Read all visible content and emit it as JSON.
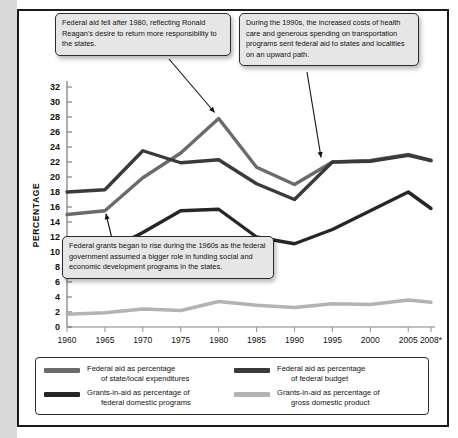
{
  "chart_data": {
    "type": "line",
    "title": "",
    "xlabel": "",
    "ylabel": "PERCENTAGE",
    "xlim": [
      1960,
      2008
    ],
    "ylim": [
      0,
      32
    ],
    "grid": false,
    "legend_position": "bottom",
    "x": [
      1960,
      1965,
      1970,
      1975,
      1980,
      1985,
      1990,
      1995,
      2000,
      2005,
      2008
    ],
    "xticklabels": [
      "1960",
      "1965",
      "1970",
      "1975",
      "1980",
      "1985",
      "1990",
      "1995",
      "2000",
      "2005",
      "2008*"
    ],
    "yticks": [
      0,
      2,
      4,
      6,
      8,
      10,
      12,
      14,
      16,
      18,
      20,
      22,
      24,
      26,
      28,
      30,
      32
    ],
    "series": [
      {
        "name": "Federal aid as percentage of state/local expenditures",
        "color": "#6b6b6b",
        "values": [
          15.0,
          15.5,
          19.9,
          23.2,
          27.8,
          21.3,
          19.0,
          22.0,
          22.2,
          23.0,
          22.2
        ]
      },
      {
        "name": "Federal aid as percentage of federal budget",
        "color": "#3a3a3a",
        "values": [
          18.0,
          18.3,
          23.5,
          21.9,
          22.3,
          19.1,
          17.0,
          22.0,
          22.1,
          22.9,
          22.2
        ]
      },
      {
        "name": "Grants-in-aid as percentage of federal domestic programs",
        "color": "#262626",
        "values": [
          7.5,
          10.0,
          12.6,
          15.5,
          15.7,
          12.0,
          11.1,
          13.0,
          15.5,
          18.0,
          15.8
        ]
      },
      {
        "name": "Grants-in-aid as percentage of gross domestic product",
        "color": "#b3b3b3",
        "values": [
          1.7,
          1.9,
          2.4,
          2.2,
          3.4,
          2.9,
          2.6,
          3.1,
          3.0,
          3.6,
          3.3
        ]
      }
    ]
  },
  "annotations": [
    {
      "id": "callout-reagan",
      "text": "Federal aid fell after 1980, reflecting Ronald Reagan's desire to return more responsibility to the states.",
      "target_year": 1980
    },
    {
      "id": "callout-1990s",
      "text": "During the 1990s, the increased costs of health care and generous spending on transportation programs sent federal aid to states and localities on an upward path.",
      "target_year": 1995
    },
    {
      "id": "callout-1960s",
      "text": "Federal grants began to rise during the 1960s as the federal government assumed a bigger role in funding social and economic development programs in the states.",
      "target_year": 1965
    }
  ],
  "legend": {
    "items": [
      {
        "line1": "Federal aid as percentage",
        "line2": "of state/local expenditures",
        "color": "#6b6b6b"
      },
      {
        "line1": "Federal aid as percentage",
        "line2": "of federal budget",
        "color": "#3a3a3a"
      },
      {
        "line1": "Grants-in-aid as percentage of",
        "line2": "federal domestic programs",
        "color": "#262626"
      },
      {
        "line1": "Grants-in-aid as percentage of",
        "line2": "gross domestic product",
        "color": "#b3b3b3"
      }
    ]
  },
  "colors": {
    "frame": "#1a1a1a",
    "gutter": "#d9d9d9",
    "callout_fill": "#e6e6e6",
    "callout_border": "#2b2b2b",
    "background": "#ffffff"
  }
}
